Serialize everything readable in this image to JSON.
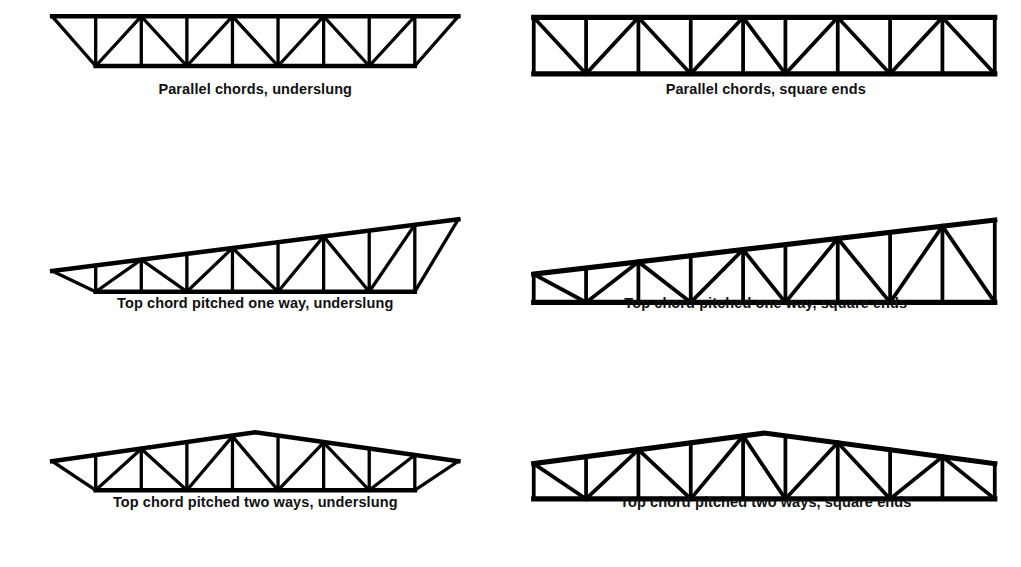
{
  "page": {
    "background_color": "#ffffff",
    "line_color": "#000000",
    "columns": 2,
    "rows": 3
  },
  "figures": [
    {
      "id": "parallel-chords-underslung",
      "caption": "Parallel chords, underslung",
      "top_chord": "parallel",
      "ends": "underslung",
      "panels": 8
    },
    {
      "id": "parallel-chords-square-ends",
      "caption": "Parallel chords, square ends",
      "top_chord": "parallel",
      "ends": "square",
      "panels": 9
    },
    {
      "id": "top-chord-pitched-one-way-underslung",
      "caption": "Top chord pitched one way, underslung",
      "top_chord": "pitched-one-way",
      "ends": "underslung",
      "panels": 8
    },
    {
      "id": "top-chord-pitched-one-way-square-ends",
      "caption": "Top chord pitched one way, square ends",
      "top_chord": "pitched-one-way",
      "ends": "square",
      "panels": 9
    },
    {
      "id": "top-chord-pitched-two-ways-underslung",
      "caption": "Top chord pitched two ways, underslung",
      "top_chord": "pitched-two-ways",
      "ends": "underslung",
      "panels": 8
    },
    {
      "id": "top-chord-pitched-two-ways-square-ends",
      "caption": "Top chord pitched two ways, square ends",
      "top_chord": "pitched-two-ways",
      "ends": "square",
      "panels": 9
    }
  ]
}
